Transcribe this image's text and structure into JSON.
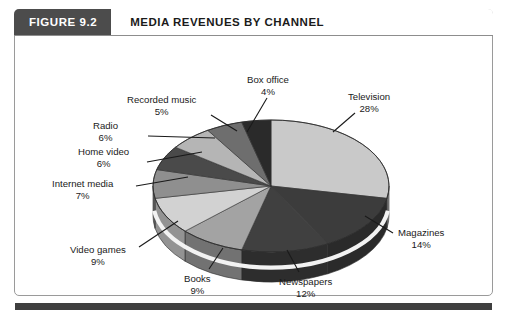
{
  "figure": {
    "badge_label": "FIGURE 9.2",
    "title": "MEDIA REVENUES BY CHANNEL"
  },
  "chart_data": {
    "type": "pie",
    "title": "MEDIA REVENUES BY CHANNEL",
    "xlabel": "",
    "ylabel": "",
    "unit": "%",
    "three_d": true,
    "legend_position": "none",
    "labels_outside": true,
    "categories": [
      "Television",
      "Magazines",
      "Newspapers",
      "Books",
      "Video games",
      "Internet media",
      "Home video",
      "Radio",
      "Recorded music",
      "Box office"
    ],
    "values": [
      28,
      14,
      12,
      9,
      9,
      7,
      6,
      6,
      5,
      4
    ],
    "total": 100,
    "slices": [
      {
        "name": "Television",
        "value": 28,
        "label": "Television",
        "pct_text": "28%",
        "color": "#c9c9c9"
      },
      {
        "name": "Magazines",
        "value": 14,
        "label": "Magazines",
        "pct_text": "14%",
        "color": "#3c3c3c"
      },
      {
        "name": "Newspapers",
        "value": 12,
        "label": "Newspapers",
        "pct_text": "12%",
        "color": "#404040"
      },
      {
        "name": "Books",
        "value": 9,
        "label": "Books",
        "pct_text": "9%",
        "color": "#a3a3a3"
      },
      {
        "name": "Video games",
        "value": 9,
        "label": "Video games",
        "pct_text": "9%",
        "color": "#d2d2d2"
      },
      {
        "name": "Internet media",
        "value": 7,
        "label": "Internet media",
        "pct_text": "7%",
        "color": "#8f8f8f"
      },
      {
        "name": "Home video",
        "value": 6,
        "label": "Home video",
        "pct_text": "6%",
        "color": "#4a4a4a"
      },
      {
        "name": "Radio",
        "value": 6,
        "label": "Radio",
        "pct_text": "6%",
        "color": "#b5b5b5"
      },
      {
        "name": "Recorded music",
        "value": 5,
        "label": "Recorded music",
        "pct_text": "5%",
        "color": "#6e6e6e"
      },
      {
        "name": "Box office",
        "value": 4,
        "label": "Box office",
        "pct_text": "4%",
        "color": "#2a2a2a"
      }
    ]
  },
  "colors": {
    "badge_background": "#4c4c4c",
    "badge_text": "#ffffff",
    "title_text": "#1b1b1b",
    "frame_border": "#9a9a9a",
    "bottom_rule": "#3f3f3f",
    "label_text": "#1a1a1a"
  }
}
